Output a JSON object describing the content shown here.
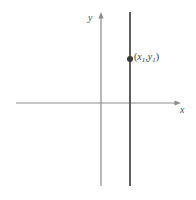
{
  "figure": {
    "type": "coordinate-plane-diagram",
    "background_color": "#ffffff",
    "axis_color": "#8c8c8c",
    "line_color": "#555555",
    "point_color": "#3a3a3a",
    "label_color": "#4a4a4a"
  },
  "axes": {
    "x_axis": {
      "label": "x",
      "start_x": 16,
      "end_x": 180,
      "y": 103,
      "arrow": "right"
    },
    "y_axis": {
      "label": "y",
      "x": 101,
      "start_y": 186,
      "end_y": 13,
      "arrow": "up"
    },
    "origin": {
      "x": 101,
      "y": 103
    }
  },
  "graph": {
    "description": "vertical line",
    "equation_form": "x = x1",
    "line": {
      "x": 130,
      "top_y": 12,
      "bottom_y": 186
    },
    "point": {
      "x": 130,
      "y": 59,
      "radius": 3,
      "label_open_paren": "(",
      "label_x_var": "x",
      "label_x_sub": "1",
      "label_comma": ",",
      "label_y_var": "y",
      "label_y_sub": "1",
      "label_close_paren": ")"
    }
  }
}
